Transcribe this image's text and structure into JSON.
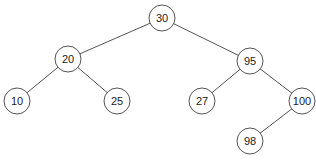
{
  "diagram": {
    "type": "binary-search-tree",
    "node_radius": 13,
    "colors": {
      "stroke": "#555555",
      "fill": "#ffffff",
      "text": "#222222"
    },
    "nodes": [
      {
        "id": "n30",
        "label": "30",
        "x": 162,
        "y": 18
      },
      {
        "id": "n20",
        "label": "20",
        "x": 68,
        "y": 59
      },
      {
        "id": "n95",
        "label": "95",
        "x": 250,
        "y": 61
      },
      {
        "id": "n10",
        "label": "10",
        "x": 17,
        "y": 101
      },
      {
        "id": "n25",
        "label": "25",
        "x": 117,
        "y": 101
      },
      {
        "id": "n27",
        "label": "27",
        "x": 202,
        "y": 101
      },
      {
        "id": "n100",
        "label": "100",
        "x": 302,
        "y": 101
      },
      {
        "id": "n98",
        "label": "98",
        "x": 250,
        "y": 141
      }
    ],
    "edges": [
      {
        "from": "n30",
        "to": "n20"
      },
      {
        "from": "n30",
        "to": "n95"
      },
      {
        "from": "n20",
        "to": "n10"
      },
      {
        "from": "n20",
        "to": "n25"
      },
      {
        "from": "n95",
        "to": "n27"
      },
      {
        "from": "n95",
        "to": "n100"
      },
      {
        "from": "n100",
        "to": "n98"
      }
    ]
  }
}
